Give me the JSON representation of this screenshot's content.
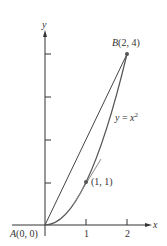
{
  "labels": {
    "y_axis": "y",
    "x_axis": "x",
    "point_b": "B(2, 4)",
    "point_a": "A(0, 0)",
    "curve": "y = x",
    "curve_exp": "2",
    "tangent_point": "(1, 1)",
    "tick_1": "1",
    "tick_2": "2"
  },
  "colors": {
    "curve": "#555555",
    "tangent": "#888888",
    "axis": "#333333"
  }
}
